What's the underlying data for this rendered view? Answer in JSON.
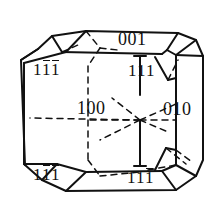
{
  "figure": {
    "kind": "crystal-habit-diagram",
    "stroke_color": "#111111",
    "background_color": "#ffffff",
    "solid_edge_style": "solid",
    "hidden_edge_style": "dashed"
  },
  "labels": {
    "top_face": {
      "name": "001",
      "digits": [
        {
          "text": "0",
          "bar": false
        },
        {
          "text": "0",
          "bar": false
        },
        {
          "text": "1",
          "bar": false
        }
      ]
    },
    "upper_left_face": {
      "name": "1-11-1",
      "digits": [
        {
          "text": "1",
          "bar": false
        },
        {
          "text": "1",
          "bar": true
        },
        {
          "text": "1",
          "bar": true
        }
      ]
    },
    "upper_right_face": {
      "name": "111",
      "digits": [
        {
          "text": "1",
          "bar": false
        },
        {
          "text": "1",
          "bar": false
        },
        {
          "text": "1",
          "bar": false
        }
      ]
    },
    "front_face": {
      "name": "100",
      "digits": [
        {
          "text": "1",
          "bar": false
        },
        {
          "text": "0",
          "bar": false
        },
        {
          "text": "0",
          "bar": false
        }
      ]
    },
    "right_face": {
      "name": "010",
      "digits": [
        {
          "text": "0",
          "bar": false
        },
        {
          "text": "1",
          "bar": false
        },
        {
          "text": "0",
          "bar": false
        }
      ]
    },
    "lower_left_face": {
      "name": "1-11-1",
      "digits": [
        {
          "text": "1",
          "bar": false
        },
        {
          "text": "1",
          "bar": true
        },
        {
          "text": "1",
          "bar": true
        }
      ]
    },
    "lower_right_face": {
      "name": "111-1",
      "digits": [
        {
          "text": "1",
          "bar": false
        },
        {
          "text": "1",
          "bar": false
        },
        {
          "text": "1",
          "bar": true
        }
      ]
    }
  },
  "geometry": {
    "solid_edges": [
      "M 38,49 L 52,36 L 86,31 L 178,33 L 196,40 L 203,56 L 203,160 L 196,176 L 176,190 L 66,191 L 42,180 L 25,165 L 21,60 L 38,49",
      "M 21,60 L 38,49",
      "M 52,36 L 62,52",
      "M 86,31 L 66,52",
      "M 62,52 L 162,54",
      "M 66,52 L 24,63",
      "M 178,33 L 167,50",
      "M 196,40 L 176,55",
      "M 203,56 L 176,55",
      "M 167,50 L 176,55",
      "M 162,54 L 167,50",
      "M 176,55 L 176,165",
      "M 24,63 L 24,164",
      "M 25,165 L 24,164",
      "M 42,180 L 57,164",
      "M 57,164 L 24,164",
      "M 66,191 L 86,172",
      "M 86,172 L 57,164",
      "M 176,190 L 162,171",
      "M 162,171 L 176,165",
      "M 196,176 L 176,165",
      "M 86,172 L 162,171",
      "M 140,56 L 140,95",
      "M 140,120 L 140,166",
      "M 134,166 L 146,166",
      "M 134,56 L 146,56",
      "M 155,57 L 168,80",
      "M 168,80 L 176,78",
      "M 155,170 L 166,148",
      "M 166,148 L 176,150"
    ],
    "dashed_edges": [
      "M 86,31 L 100,48",
      "M 100,48 L 118,50",
      "M 62,52 L 78,45",
      "M 100,48 L 88,66",
      "M 88,66 L 88,120",
      "M 88,120 L 88,160",
      "M 88,160 L 100,176",
      "M 100,176 L 140,172",
      "M 140,120 L 88,120",
      "M 140,120 L 30,118",
      "M 140,120 L 176,120",
      "M 140,120 L 100,140",
      "M 140,120 L 176,104",
      "M 140,120 L 112,98",
      "M 140,120 L 168,132",
      "M 168,80 L 178,60",
      "M 166,148 L 186,164",
      "M 176,150 L 192,162",
      "M 148,170 L 176,165"
    ]
  }
}
